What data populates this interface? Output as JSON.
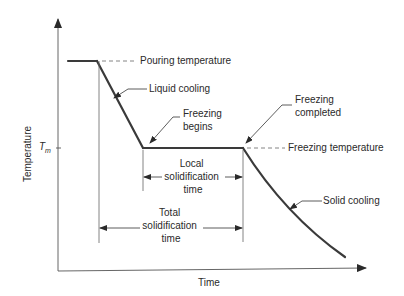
{
  "diagram": {
    "axes": {
      "x_label": "Time",
      "y_label": "Temperature",
      "y_tick_label": "T",
      "y_tick_subscript": "m"
    },
    "labels": {
      "pouring_temperature": "Pouring temperature",
      "liquid_cooling": "Liquid cooling",
      "freezing_begins_1": "Freezing",
      "freezing_begins_2": "begins",
      "freezing_completed_1": "Freezing",
      "freezing_completed_2": "completed",
      "freezing_temperature": "Freezing temperature",
      "local_1": "Local",
      "local_2": "solidification",
      "local_3": "time",
      "total_1": "Total",
      "total_2": "solidification",
      "total_3": "time",
      "solid_cooling": "Solid cooling"
    },
    "colors": {
      "curve": "#3a3a3a",
      "axis": "#555555",
      "text": "#2a2a2a",
      "background": "#ffffff"
    }
  }
}
